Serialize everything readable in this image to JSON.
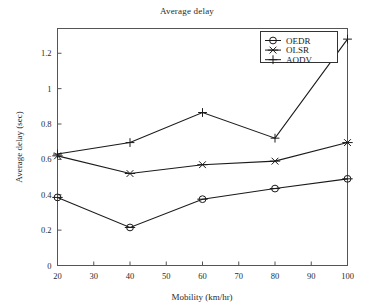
{
  "chart_data": {
    "type": "line",
    "title": "Average delay",
    "xlabel": "Mobility (km/hr)",
    "ylabel": "Average delay (sec)",
    "x": [
      20,
      40,
      60,
      80,
      100
    ],
    "xticks": [
      20,
      30,
      40,
      50,
      60,
      70,
      80,
      90,
      100
    ],
    "xtick_labels": [
      "20",
      "30",
      "40",
      "50",
      "60",
      "70",
      "80",
      "90",
      "100"
    ],
    "yticks": [
      0,
      0.2,
      0.4,
      0.6,
      0.8,
      1,
      1.2
    ],
    "ytick_labels": [
      "0",
      "0.2",
      "0.4",
      "0.6",
      "0.8",
      "1",
      "1.2"
    ],
    "xlim": [
      20,
      100
    ],
    "ylim": [
      0,
      1.34
    ],
    "grid": false,
    "legend_position": "top-right",
    "series": [
      {
        "name": "OEDR",
        "marker": "circle",
        "color": "#1a1a1a",
        "values": [
          0.385,
          0.215,
          0.375,
          0.435,
          0.49
        ]
      },
      {
        "name": "OLSR",
        "marker": "x",
        "color": "#1a1a1a",
        "values": [
          0.62,
          0.52,
          0.57,
          0.59,
          0.695
        ]
      },
      {
        "name": "AODV",
        "marker": "plus",
        "color": "#1a1a1a",
        "values": [
          0.63,
          0.695,
          0.865,
          0.72,
          1.28
        ]
      }
    ]
  },
  "legend": {
    "entries": [
      "OEDR",
      "OLSR",
      "AODV"
    ]
  }
}
